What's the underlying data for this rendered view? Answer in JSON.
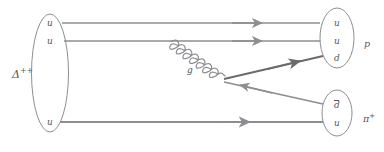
{
  "figure": {
    "kind": "quark-flow-diagram",
    "process": "Delta++ -> p + pi+",
    "stroke_color": "#8e8d92",
    "dark_stroke_color": "#6b6a6f",
    "text_color": "#59585c",
    "background": "#ffffff"
  },
  "initial_state": {
    "label_base": "Δ",
    "label_sup": "++",
    "quarks": [
      {
        "symbol": "u",
        "bar": false
      },
      {
        "symbol": "u",
        "bar": false
      },
      {
        "symbol": "u",
        "bar": false
      }
    ]
  },
  "final_states": [
    {
      "name": "proton",
      "label_base": "p",
      "label_sup": "",
      "quarks": [
        {
          "symbol": "u",
          "bar": false
        },
        {
          "symbol": "u",
          "bar": false
        },
        {
          "symbol": "d",
          "bar": false
        }
      ]
    },
    {
      "name": "pion",
      "label_base": "π",
      "label_sup": "+",
      "quarks": [
        {
          "symbol": "d",
          "bar": true
        },
        {
          "symbol": "u",
          "bar": false
        }
      ]
    }
  ],
  "mediator": {
    "label": "g",
    "type": "gluon",
    "rendering": "coiled-spiral"
  },
  "lines": [
    {
      "name": "u-quark-line-top",
      "from": "delta",
      "to": "proton",
      "arrow": "right"
    },
    {
      "name": "u-quark-line-middle",
      "from": "delta",
      "to": "proton",
      "arrow": "right"
    },
    {
      "name": "u-quark-line-bottom",
      "from": "delta",
      "to": "pion",
      "arrow": "right"
    },
    {
      "name": "d-quark-line",
      "from": "gluon-vertex",
      "to": "proton",
      "arrow": "right"
    },
    {
      "name": "dbar-antiquark-line",
      "from": "pion",
      "to": "gluon-vertex",
      "arrow": "left"
    }
  ]
}
